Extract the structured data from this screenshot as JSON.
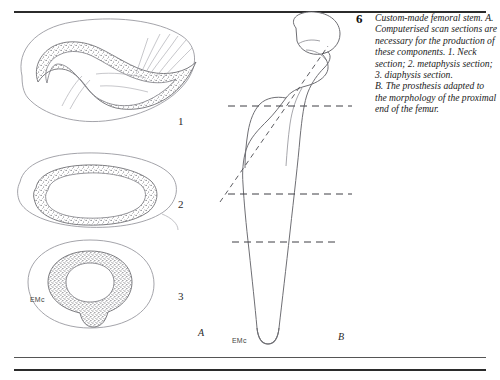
{
  "figure": {
    "number": "6",
    "caption_lines": [
      "Custom-made femoral stem. A. Computerised scan sections are necessary for the production of these components. 1. Neck section; 2. metaphysis section; 3. diaphysis section.",
      "B. The prosthesis adapted to the morphology of the proximal end of the femur."
    ]
  },
  "panels": {
    "a": {
      "label": "A",
      "signature": "EMc",
      "sections": [
        {
          "number": "1",
          "name": "neck-section"
        },
        {
          "number": "2",
          "name": "metaphysis-section"
        },
        {
          "number": "3",
          "name": "diaphysis-section"
        }
      ]
    },
    "b": {
      "label": "B",
      "signature": "EMc"
    }
  },
  "colors": {
    "background": "#ffffff",
    "rule": "#2b2b2b",
    "outline": "#6f6f74",
    "outline_light": "#9a9aa0",
    "stipple": "#55555b",
    "dashed": "#4a4a4f",
    "text": "#1a1a1a"
  }
}
